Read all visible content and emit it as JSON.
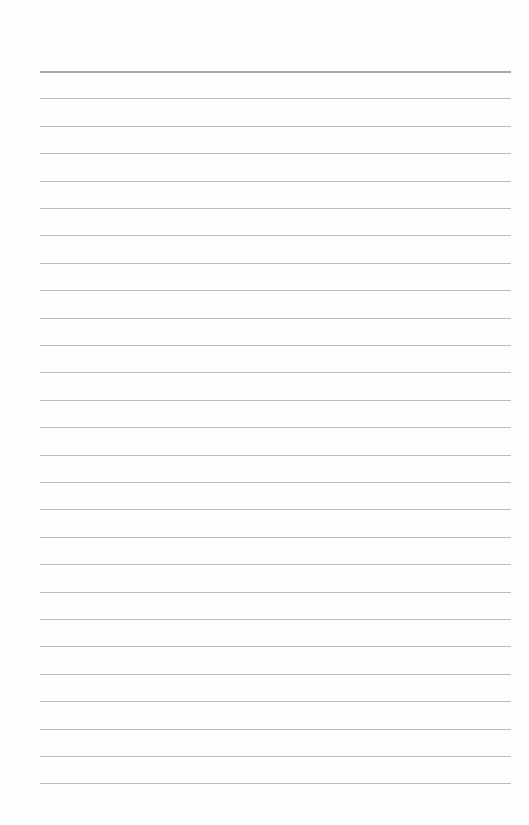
{
  "page": {
    "type": "lined-paper",
    "background_color": "#fefefe",
    "line_color": "#bdbdbd",
    "line_count": 27,
    "first_line_y": 71,
    "line_spacing": 27.4,
    "line_left": 40,
    "line_right": 511
  }
}
